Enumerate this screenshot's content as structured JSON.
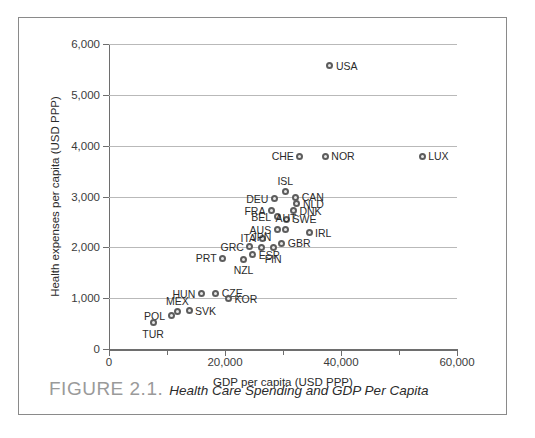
{
  "figure": {
    "caption_number": "FIGURE 2.1.",
    "caption_title": "Health Care Spending and GDP Per Capita"
  },
  "chart_data": {
    "type": "scatter",
    "title": "",
    "xlabel": "GDP per capita (USD PPP)",
    "ylabel": "Health expenses per capita (USD PPP)",
    "xlim": [
      0,
      60000
    ],
    "ylim": [
      0,
      6000
    ],
    "xticks": [
      0,
      20000,
      40000,
      60000
    ],
    "xtick_labels": [
      "0",
      "20,000",
      "40,000",
      "60,000"
    ],
    "xticks_minor": [
      10000,
      30000,
      50000
    ],
    "yticks": [
      0,
      1000,
      2000,
      3000,
      4000,
      5000,
      6000
    ],
    "ytick_labels": [
      "0",
      "1,000",
      "2,000",
      "3,000",
      "4,000",
      "5,000",
      "6,000"
    ],
    "grid": "horizontal",
    "legend": "none",
    "marker_color": "#5d5d5d",
    "marker_fill": "#e8e8e8",
    "gridline_color": "#b9b9b9",
    "points": [
      {
        "label": "USA",
        "x": 38100,
        "y": 5570,
        "pos": "right"
      },
      {
        "label": "LUX",
        "x": 54000,
        "y": 3790,
        "pos": "right"
      },
      {
        "label": "NOR",
        "x": 37300,
        "y": 3790,
        "pos": "right"
      },
      {
        "label": "CHE",
        "x": 32900,
        "y": 3790,
        "pos": "left"
      },
      {
        "label": "ISL",
        "x": 30400,
        "y": 3090,
        "pos": "top"
      },
      {
        "label": "CAN",
        "x": 32200,
        "y": 2990,
        "pos": "right"
      },
      {
        "label": "DEU",
        "x": 28500,
        "y": 2960,
        "pos": "left"
      },
      {
        "label": "NLD",
        "x": 32400,
        "y": 2860,
        "pos": "right"
      },
      {
        "label": "FRA",
        "x": 28000,
        "y": 2720,
        "pos": "left"
      },
      {
        "label": "DNK",
        "x": 31800,
        "y": 2720,
        "pos": "right"
      },
      {
        "label": "BEL",
        "x": 29000,
        "y": 2600,
        "pos": "left"
      },
      {
        "label": "SWE",
        "x": 30600,
        "y": 2550,
        "pos": "right"
      },
      {
        "label": "AUT",
        "x": 30500,
        "y": 2360,
        "pos": "top"
      },
      {
        "label": "AUS",
        "x": 29000,
        "y": 2350,
        "pos": "left"
      },
      {
        "label": "IRL",
        "x": 34500,
        "y": 2290,
        "pos": "right"
      },
      {
        "label": "ITA",
        "x": 26400,
        "y": 2180,
        "pos": "left"
      },
      {
        "label": "GBR",
        "x": 29800,
        "y": 2080,
        "pos": "right"
      },
      {
        "label": "GRC",
        "x": 24300,
        "y": 2010,
        "pos": "left"
      },
      {
        "label": "JPN",
        "x": 26300,
        "y": 1990,
        "pos": "top"
      },
      {
        "label": "FIN",
        "x": 28300,
        "y": 1990,
        "pos": "bottom"
      },
      {
        "label": "ESP",
        "x": 24800,
        "y": 1850,
        "pos": "right"
      },
      {
        "label": "PRT",
        "x": 19600,
        "y": 1790,
        "pos": "left"
      },
      {
        "label": "NZL",
        "x": 23200,
        "y": 1770,
        "pos": "bottom"
      },
      {
        "label": "CZE",
        "x": 18400,
        "y": 1100,
        "pos": "right"
      },
      {
        "label": "HUN",
        "x": 15900,
        "y": 1090,
        "pos": "left"
      },
      {
        "label": "KOR",
        "x": 20600,
        "y": 990,
        "pos": "right"
      },
      {
        "label": "SVK",
        "x": 13800,
        "y": 750,
        "pos": "right"
      },
      {
        "label": "MEX",
        "x": 11800,
        "y": 730,
        "pos": "top"
      },
      {
        "label": "POL",
        "x": 10700,
        "y": 650,
        "pos": "left"
      },
      {
        "label": "TUR",
        "x": 7600,
        "y": 520,
        "pos": "bottom"
      }
    ]
  }
}
